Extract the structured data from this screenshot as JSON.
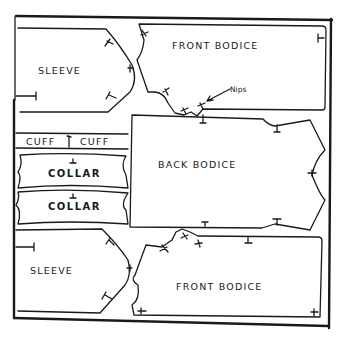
{
  "diagram": {
    "type": "sewing-pattern-layout",
    "colors": {
      "ink": "#1a1a1a",
      "paper": "#ffffff"
    },
    "pieces": [
      {
        "id": "sleeve-top",
        "label": "SLEEVE"
      },
      {
        "id": "front-bodice-top",
        "label": "FRONT BODICE"
      },
      {
        "id": "cuff-left",
        "label": "CUFF"
      },
      {
        "id": "cuff-right",
        "label": "CUFF"
      },
      {
        "id": "collar-1",
        "label": "COLLAR"
      },
      {
        "id": "collar-2",
        "label": "COLLAR"
      },
      {
        "id": "back-bodice",
        "label": "BACK BODICE"
      },
      {
        "id": "sleeve-bottom",
        "label": "SLEEVE"
      },
      {
        "id": "front-bodice-bottom",
        "label": "FRONT BODICE"
      }
    ],
    "annotations": [
      {
        "id": "nips-note",
        "label": "Nips",
        "icon": "arrow-icon"
      }
    ]
  }
}
